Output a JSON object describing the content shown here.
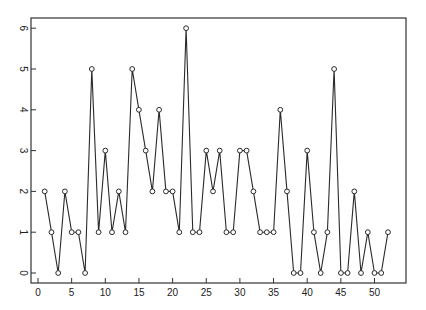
{
  "chart_data": {
    "type": "line",
    "title": "",
    "xlabel": "",
    "ylabel": "",
    "x": [
      1,
      2,
      3,
      4,
      5,
      6,
      7,
      8,
      9,
      10,
      11,
      12,
      13,
      14,
      15,
      16,
      17,
      18,
      19,
      20,
      21,
      22,
      23,
      24,
      25,
      26,
      27,
      28,
      29,
      30,
      31,
      32,
      33,
      34,
      35,
      36,
      37,
      38,
      39,
      40,
      41,
      42,
      43,
      44,
      45,
      46,
      47,
      48,
      49,
      50,
      51,
      52
    ],
    "series": [
      {
        "name": "series",
        "marker": "open-circle",
        "values": [
          2,
          1,
          0,
          2,
          1,
          1,
          0,
          5,
          1,
          3,
          1,
          2,
          1,
          5,
          4,
          3,
          2,
          4,
          2,
          2,
          1,
          6,
          1,
          1,
          3,
          2,
          3,
          1,
          1,
          3,
          3,
          2,
          1,
          1,
          1,
          4,
          2,
          0,
          0,
          3,
          1,
          0,
          1,
          5,
          0,
          0,
          2,
          0,
          1,
          0,
          0,
          1
        ]
      }
    ],
    "xticks": [
      "0",
      "5",
      "10",
      "15",
      "20",
      "25",
      "30",
      "35",
      "40",
      "45",
      "50"
    ],
    "yticks": [
      "0",
      "1",
      "2",
      "3",
      "4",
      "5",
      "6"
    ],
    "xlim": [
      -0.5,
      54
    ],
    "ylim": [
      -0.25,
      6.25
    ],
    "grid": false,
    "legend": null,
    "ytick_rotation": 90
  },
  "colors": {
    "line": "#2a2a2a",
    "marker_stroke": "#2a2a2a",
    "marker_fill": "#ffffff",
    "frame": "#333333"
  }
}
